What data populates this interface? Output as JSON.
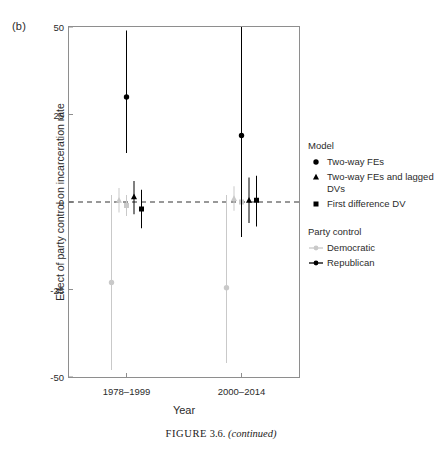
{
  "panel_label": "(b)",
  "caption": {
    "prefix": "FIGURE",
    "number": "3.6.",
    "suffix": "(continued)"
  },
  "axes": {
    "x_title": "Year",
    "y_title": "Effect of party control on incarceration rate"
  },
  "legend": {
    "model_title": "Model",
    "model_items": [
      {
        "glyph": "circle",
        "label": "Two-way FEs"
      },
      {
        "glyph": "triangle",
        "label": "Two-way FEs and lagged DVs"
      },
      {
        "glyph": "square",
        "label": "First difference DV"
      }
    ],
    "party_title": "Party control",
    "party_items": [
      {
        "key": "line-dot",
        "label": "Democratic",
        "color": "#c9c9c9"
      },
      {
        "key": "line-dot",
        "label": "Republican",
        "color": "#000000"
      }
    ]
  },
  "colors": {
    "democratic": "#c9c9c9",
    "republican": "#000000",
    "axis": "#8e8e8e",
    "zero_line": "#333333"
  },
  "chart_data": {
    "type": "scatter",
    "title": "",
    "xlabel": "Year",
    "ylabel": "Effect of party control on incarceration rate",
    "categories": [
      "1978–1999",
      "2000–2014"
    ],
    "xtick_labels": [
      "1978–1999",
      "2000–2014"
    ],
    "ytick_labels": [
      "50",
      "25",
      "0",
      "-25",
      "-50"
    ],
    "yticks": [
      50,
      25,
      0,
      -25,
      -50
    ],
    "ylim": [
      -50,
      50
    ],
    "grid": false,
    "zero_reference_line": 0,
    "legend_position": "right",
    "series": [
      {
        "name": "Democratic · Two-way FEs",
        "party": "Democratic",
        "model": "Two-way FEs",
        "glyph": "circle",
        "color": "#c9c9c9",
        "points": [
          {
            "category": "1978–1999",
            "value": -23.0,
            "ci_low": -48.0,
            "ci_high": 2.0
          },
          {
            "category": "2000–2014",
            "value": -24.5,
            "ci_low": -46.0,
            "ci_high": 2.0
          }
        ]
      },
      {
        "name": "Democratic · Two-way FEs and lagged DVs",
        "party": "Democratic",
        "model": "Two-way FEs and lagged DVs",
        "glyph": "triangle",
        "color": "#c9c9c9",
        "points": [
          {
            "category": "1978–1999",
            "value": 0.5,
            "ci_low": -3.0,
            "ci_high": 4.0
          },
          {
            "category": "2000–2014",
            "value": 1.0,
            "ci_low": -2.5,
            "ci_high": 4.5
          }
        ]
      },
      {
        "name": "Democratic · First difference DV",
        "party": "Democratic",
        "model": "First difference DV",
        "glyph": "square",
        "color": "#c9c9c9",
        "points": [
          {
            "category": "1978–1999",
            "value": -1.0,
            "ci_low": -4.0,
            "ci_high": 2.0
          },
          {
            "category": "2000–2014",
            "value": 0.0,
            "ci_low": -3.0,
            "ci_high": 3.0
          }
        ]
      },
      {
        "name": "Republican · Two-way FEs",
        "party": "Republican",
        "model": "Two-way FEs",
        "glyph": "circle",
        "color": "#000000",
        "points": [
          {
            "category": "1978–1999",
            "value": 30.0,
            "ci_low": 14.0,
            "ci_high": 49.0
          },
          {
            "category": "2000–2014",
            "value": 19.0,
            "ci_low": -10.0,
            "ci_high": 50.0
          }
        ]
      },
      {
        "name": "Republican · Two-way FEs and lagged DVs",
        "party": "Republican",
        "model": "Two-way FEs and lagged DVs",
        "glyph": "triangle",
        "color": "#000000",
        "points": [
          {
            "category": "1978–1999",
            "value": 1.5,
            "ci_low": -3.5,
            "ci_high": 6.0
          },
          {
            "category": "2000–2014",
            "value": 0.5,
            "ci_low": -6.0,
            "ci_high": 7.0
          }
        ]
      },
      {
        "name": "Republican · First difference DV",
        "party": "Republican",
        "model": "First difference DV",
        "glyph": "square",
        "color": "#000000",
        "points": [
          {
            "category": "1978–1999",
            "value": -2.0,
            "ci_low": -7.5,
            "ci_high": 3.5
          },
          {
            "category": "2000–2014",
            "value": 0.5,
            "ci_low": -7.0,
            "ci_high": 7.5
          }
        ]
      }
    ]
  }
}
